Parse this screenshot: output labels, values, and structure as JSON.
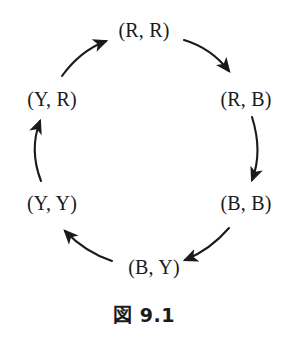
{
  "figure": {
    "caption": "図 9.1",
    "background_color": "#ffffff",
    "ink_color": "#1a1a1a"
  },
  "diagram": {
    "type": "directed-cycle",
    "direction": "clockwise",
    "node_count": 6,
    "nodes": [
      {
        "id": "rr",
        "label": "(R, R)",
        "position": "top",
        "cx": 144,
        "cy": 30
      },
      {
        "id": "rb",
        "label": "(R, B)",
        "position": "upper-right",
        "cx": 246,
        "cy": 99
      },
      {
        "id": "bb",
        "label": "(B, B)",
        "position": "lower-right",
        "cx": 246,
        "cy": 203
      },
      {
        "id": "by",
        "label": "(B, Y)",
        "position": "bottom",
        "cx": 154,
        "cy": 267
      },
      {
        "id": "yy",
        "label": "(Y, Y)",
        "position": "lower-left",
        "cx": 52,
        "cy": 203
      },
      {
        "id": "yr",
        "label": "(Y, R)",
        "position": "upper-left",
        "cx": 52,
        "cy": 99
      }
    ],
    "edges": [
      {
        "id": "rr-rb",
        "from": "(R, R)",
        "to": "(R, B)"
      },
      {
        "id": "rb-bb",
        "from": "(R, B)",
        "to": "(B, B)"
      },
      {
        "id": "bb-by",
        "from": "(B, B)",
        "to": "(B, Y)"
      },
      {
        "id": "by-yy",
        "from": "(B, Y)",
        "to": "(Y, Y)"
      },
      {
        "id": "yy-yr",
        "from": "(Y, Y)",
        "to": "(Y, R)"
      },
      {
        "id": "yr-rr",
        "from": "(Y, R)",
        "to": "(R, R)"
      }
    ]
  }
}
